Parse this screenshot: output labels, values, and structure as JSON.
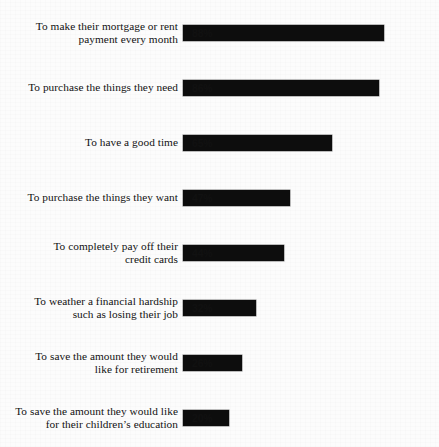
{
  "chart_data": {
    "type": "bar",
    "orientation": "horizontal",
    "title": "",
    "subtitle": "",
    "xlabel": "",
    "ylabel": "",
    "xlim": [
      0,
      100
    ],
    "grid": false,
    "legend": false,
    "value_suffix": "%",
    "categories": [
      "To make their mortgage or rent\npayment every month",
      "To purchase the things they need",
      "To have a good time",
      "To purchase the things they want",
      "To completely pay off their\ncredit cards",
      "To weather a financial hardship\nsuch as losing their job",
      "To save the amount they would\nlike for retirement",
      "To save the amount they would like\nfor their children’s education"
    ],
    "values": [
      88,
      86,
      65,
      47,
      44,
      32,
      26,
      20
    ],
    "value_labels": [
      "88%",
      "86%",
      "65%",
      "47%",
      "44%",
      "32%",
      "26%",
      "20%"
    ],
    "bar_color": "#0d0d0d",
    "background_color": "#fcfcfc",
    "rows": [
      {
        "label": "To make their mortgage or rent\npayment every month",
        "value": 88,
        "value_label": "88%",
        "top": 25
      },
      {
        "label": "To purchase the things they need",
        "value": 86,
        "value_label": "86%",
        "top": 80
      },
      {
        "label": "To have a good time",
        "value": 65,
        "value_label": "65%",
        "top": 135
      },
      {
        "label": "To purchase the things they want",
        "value": 47,
        "value_label": "47%",
        "top": 190
      },
      {
        "label": "To completely pay off their\ncredit cards",
        "value": 44,
        "value_label": "44%",
        "top": 245
      },
      {
        "label": "To weather a financial hardship\nsuch as losing their job",
        "value": 32,
        "value_label": "32%",
        "top": 300
      },
      {
        "label": "To save the amount they would\nlike for retirement",
        "value": 26,
        "value_label": "26%",
        "top": 355
      },
      {
        "label": "To save the amount they would like\nfor their children’s education",
        "value": 20,
        "value_label": "20%",
        "top": 410
      }
    ]
  }
}
